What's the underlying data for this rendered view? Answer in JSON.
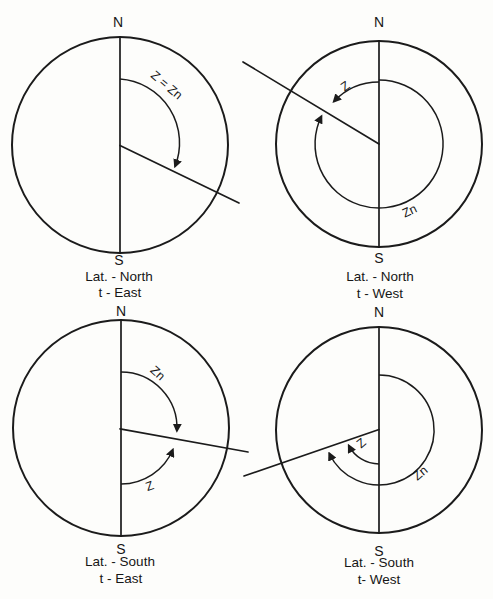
{
  "figures": [
    {
      "id": "lat-north-t-east",
      "north_label": "N",
      "south_label": "S",
      "caption_line1": "Lat. - North",
      "caption_line2": "t - East",
      "labels": {
        "z_equals_zn": "Z = Zn"
      }
    },
    {
      "id": "lat-north-t-west",
      "north_label": "N",
      "south_label": "S",
      "caption_line1": "Lat. - North",
      "caption_line2": "t - West",
      "labels": {
        "z": "Z",
        "zn": "Zn"
      }
    },
    {
      "id": "lat-south-t-east",
      "north_label": "N",
      "south_label": "S",
      "caption_line1": "Lat. - South",
      "caption_line2": "t - East",
      "labels": {
        "z": "Z",
        "zn": "Zn"
      }
    },
    {
      "id": "lat-south-t-west",
      "north_label": "N",
      "south_label": "S",
      "caption_line1": "Lat. - South",
      "caption_line2": "t- West",
      "labels": {
        "z": "Z",
        "zn": "Zn"
      }
    }
  ]
}
